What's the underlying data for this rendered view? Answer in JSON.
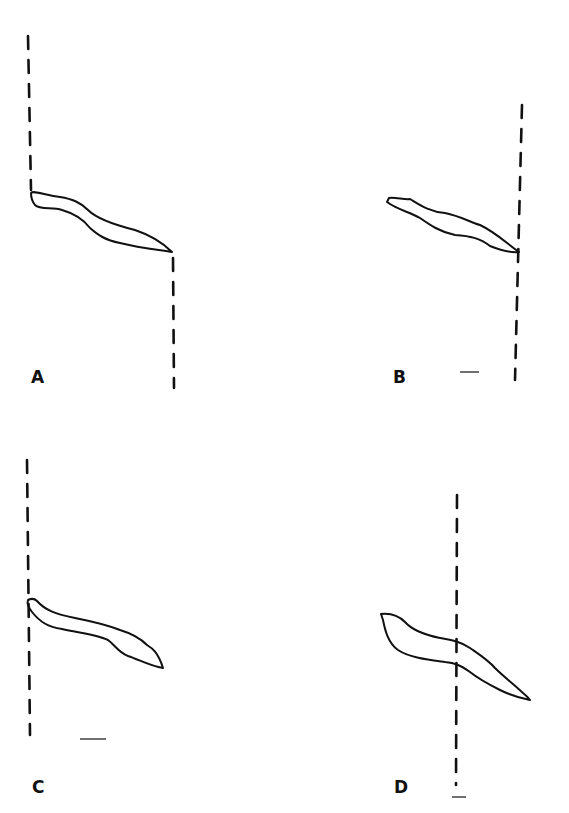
{
  "figure": {
    "type": "hand-drawn cell outline tracings with dashed reference lines",
    "panels": [
      {
        "id": "A",
        "label": "A",
        "reference_line": "left-top and right-bottom dashed lines",
        "scale_bar": false
      },
      {
        "id": "B",
        "label": "B",
        "reference_line": "right dashed line",
        "scale_bar": true
      },
      {
        "id": "C",
        "label": "C",
        "reference_line": "left dashed line",
        "scale_bar": true
      },
      {
        "id": "D",
        "label": "D",
        "reference_line": "dashed line crossing cell",
        "scale_bar": true
      }
    ],
    "colors": {
      "ink": "#111111",
      "background": "#ffffff"
    }
  }
}
